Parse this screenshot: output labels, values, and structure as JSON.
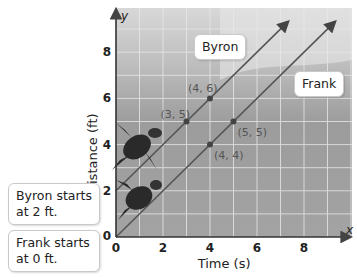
{
  "chart_data": {
    "type": "line",
    "title": "",
    "xlabel": "Time (s)",
    "ylabel": "Distance (ft)",
    "x_axis_letter": "x",
    "y_axis_letter": "y",
    "xlim": [
      0,
      10
    ],
    "ylim": [
      0,
      9.5
    ],
    "xticks": [
      0,
      2,
      4,
      6,
      8
    ],
    "yticks": [
      0,
      2,
      4,
      6,
      8
    ],
    "grid": true,
    "series": [
      {
        "name": "Byron",
        "equation": "y = x + 2",
        "x": [
          0,
          3,
          4
        ],
        "y": [
          2,
          5,
          6
        ],
        "points": [
          {
            "label": "(3, 5)",
            "x": 3,
            "y": 5
          },
          {
            "label": "(4, 6)",
            "x": 4,
            "y": 6
          }
        ],
        "color": "#555555"
      },
      {
        "name": "Frank",
        "equation": "y = x",
        "x": [
          0,
          4,
          5
        ],
        "y": [
          0,
          4,
          5
        ],
        "points": [
          {
            "label": "(4, 4)",
            "x": 4,
            "y": 4
          },
          {
            "label": "(5, 5)",
            "x": 5,
            "y": 5
          }
        ],
        "color": "#555555"
      }
    ],
    "annotations": [
      {
        "text": "Byron starts at 2 ft.",
        "line1": "Byron starts",
        "line2": "at 2 ft."
      },
      {
        "text": "Frank starts at 0 ft.",
        "line1": "Frank starts",
        "line2": "at 0 ft."
      }
    ],
    "line_labels": {
      "byron": "Byron",
      "frank": "Frank"
    }
  }
}
